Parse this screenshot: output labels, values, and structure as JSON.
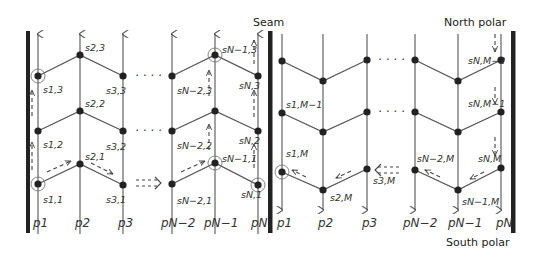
{
  "titles": {
    "seam": "Seam",
    "north_polar": "North polar",
    "south_polar": "South polar"
  },
  "colors": {
    "line": "#555555",
    "node": "#222222",
    "bar": "#222222",
    "text": "#333333"
  },
  "left_panel": {
    "column_labels": [
      "p1",
      "p2",
      "p3",
      "pN−2",
      "pN−1",
      "pN"
    ],
    "node_labels": {
      "s11": "s1,1",
      "s21": "s2,1",
      "s31": "s3,1",
      "s12": "s1,2",
      "s22": "s2,2",
      "s32": "s3,2",
      "s13": "s1,3",
      "s23": "s2,3",
      "s33": "s3,3",
      "sN2_1": "sN−2,1",
      "sN1_1": "sN−1,1",
      "sN_1": "sN,1",
      "sN2_2": "sN−2,2",
      "sN_2": "sN,2",
      "sN2_3": "sN−2,3",
      "sN1_3": "sN−1,3",
      "sN_3": "sN,3"
    },
    "ellipsis": "· · · ·"
  },
  "right_panel": {
    "column_labels": [
      "p1",
      "p2",
      "p3",
      "pN−2",
      "pN−1",
      "pN"
    ],
    "node_labels": {
      "s1M1": "s1,M−1",
      "s1M": "s1,M",
      "s2M": "s2,M",
      "s3M": "s3,M",
      "sN2M": "sN−2,M",
      "sN1M": "sN−1,M",
      "sNM": "sN,M",
      "sNM1": "sN,M−1",
      "sNM2": "sN,M−2"
    },
    "ellipsis": "· · · ·"
  }
}
